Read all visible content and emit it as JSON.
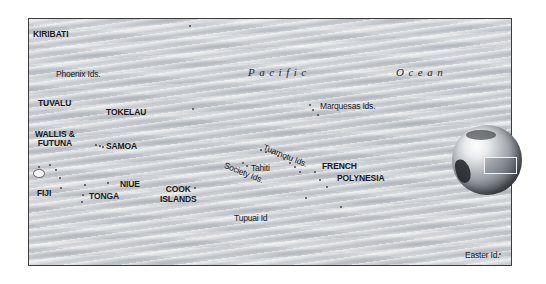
{
  "map": {
    "ocean_labels": [
      "Pacific",
      "Ocean"
    ],
    "countries": {
      "kiribati": "KIRIBATI",
      "tuvalu": "TUVALU",
      "tokelau": "TOKELAU",
      "wallis_futuna_line1": "WALLIS &",
      "wallis_futuna_line2": "FUTUNA",
      "samoa": "SAMOA",
      "fiji": "FIJI",
      "tonga": "TONGA",
      "niue": "NIUE",
      "cook_islands_line1": "COOK",
      "cook_islands_line2": "ISLANDS",
      "french_polynesia_line1": "FRENCH",
      "french_polynesia_line2": "POLYNESIA"
    },
    "islands": {
      "phoenix": "Phoenix Ids.",
      "marquesas": "Marquesas Ids.",
      "tuamotu": "Tuamotu Ids.",
      "tahiti": "Tahiti",
      "society": "Society Ids.",
      "tupuai": "Tupuai Id",
      "easter": "Easter Id."
    },
    "locator": {
      "icon": "globe-icon",
      "highlight": "locator-rectangle"
    },
    "colors": {
      "ocean": "#d2d4d7",
      "frame_border": "#3c3c3c",
      "text": "#1a1a1a"
    }
  }
}
